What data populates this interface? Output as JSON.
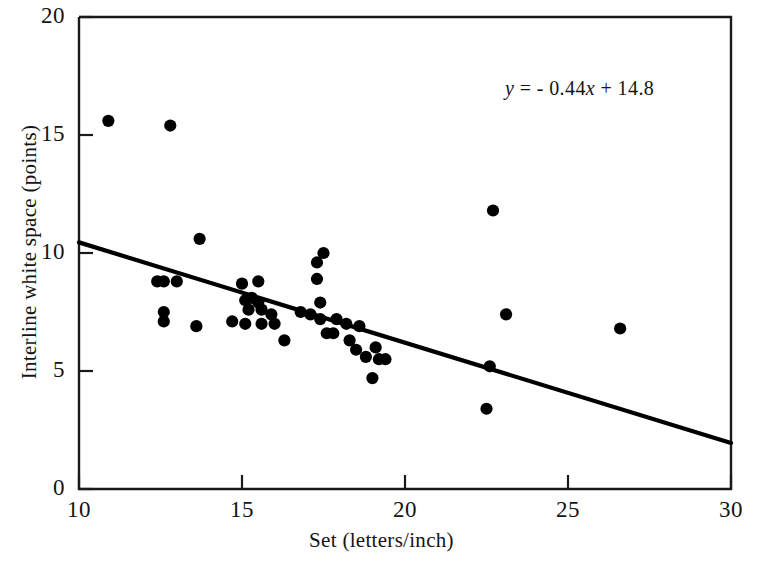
{
  "chart_data": {
    "type": "scatter",
    "title": "",
    "xlabel": "Set (letters/inch)",
    "ylabel": "Interline white space (points)",
    "xlim": [
      10,
      30
    ],
    "ylim": [
      0,
      20
    ],
    "xticks": [
      10,
      15,
      20,
      25,
      30
    ],
    "yticks": [
      0,
      5,
      10,
      15,
      20
    ],
    "grid": false,
    "legend": null,
    "annotations": [
      {
        "name": "regression-equation",
        "text": "y = - 0.44x + 14.8",
        "x": 25.3,
        "y": 17.5
      }
    ],
    "series": [
      {
        "name": "observations",
        "type": "scatter",
        "marker": "filled-circle",
        "color": "#000000",
        "points": [
          [
            10.9,
            15.6
          ],
          [
            12.8,
            15.4
          ],
          [
            13.7,
            10.6
          ],
          [
            12.4,
            8.8
          ],
          [
            12.6,
            8.8
          ],
          [
            13.0,
            8.8
          ],
          [
            12.6,
            7.5
          ],
          [
            12.6,
            7.1
          ],
          [
            13.6,
            6.9
          ],
          [
            15.0,
            8.7
          ],
          [
            14.7,
            7.1
          ],
          [
            15.1,
            8.0
          ],
          [
            15.3,
            8.1
          ],
          [
            15.2,
            7.6
          ],
          [
            15.1,
            7.0
          ],
          [
            15.5,
            8.8
          ],
          [
            15.5,
            7.9
          ],
          [
            15.6,
            7.6
          ],
          [
            15.9,
            7.4
          ],
          [
            15.6,
            7.0
          ],
          [
            16.0,
            7.0
          ],
          [
            16.3,
            6.3
          ],
          [
            16.8,
            7.5
          ],
          [
            17.1,
            7.4
          ],
          [
            17.3,
            9.6
          ],
          [
            17.3,
            8.9
          ],
          [
            17.4,
            7.9
          ],
          [
            17.4,
            7.2
          ],
          [
            17.5,
            10.0
          ],
          [
            17.6,
            6.6
          ],
          [
            17.8,
            6.6
          ],
          [
            17.9,
            7.2
          ],
          [
            18.2,
            7.0
          ],
          [
            18.3,
            6.3
          ],
          [
            18.5,
            5.9
          ],
          [
            18.6,
            6.9
          ],
          [
            18.8,
            5.6
          ],
          [
            19.1,
            6.0
          ],
          [
            19.2,
            5.5
          ],
          [
            19.4,
            5.5
          ],
          [
            19.0,
            4.7
          ],
          [
            22.5,
            3.4
          ],
          [
            22.7,
            11.8
          ],
          [
            22.6,
            5.2
          ],
          [
            23.1,
            7.4
          ],
          [
            26.6,
            6.8
          ]
        ]
      },
      {
        "name": "regression-line",
        "type": "line",
        "color": "#000000",
        "slope": -0.44,
        "intercept": 14.8,
        "endpoints": [
          [
            10,
            10.45
          ],
          [
            30,
            1.95
          ]
        ]
      }
    ]
  },
  "axes": {
    "x_tick_labels": [
      "10",
      "15",
      "20",
      "25",
      "30"
    ],
    "y_tick_labels": [
      "0",
      "5",
      "10",
      "15",
      "20"
    ],
    "x_title": "Set (letters/inch)",
    "y_title": "Interline white space (points)"
  },
  "annotation": {
    "equation_y": "y",
    "equation_body": " = - 0.44",
    "equation_x": "x",
    "equation_tail": " + 14.8"
  },
  "colors": {
    "background": "#ffffff",
    "ink": "#000000",
    "text": "#141414"
  }
}
